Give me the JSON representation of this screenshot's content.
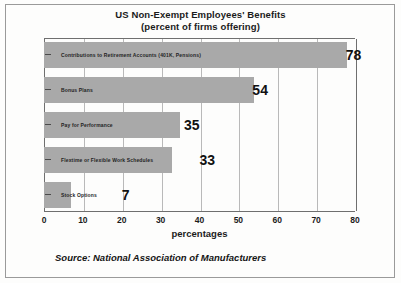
{
  "chart_data": {
    "type": "bar",
    "orientation": "horizontal",
    "title": "US Non-Exempt Employees' Benefits",
    "subtitle": "(percent of firms offering)",
    "xlabel": "percentages",
    "ylabel": "",
    "xlim": [
      0,
      80
    ],
    "xticks": [
      0,
      10,
      20,
      30,
      40,
      50,
      60,
      70,
      80
    ],
    "xtick_labels": [
      "0",
      "10",
      "20",
      "30",
      "40",
      "50",
      "60",
      "70",
      "80"
    ],
    "grid": true,
    "grid_axis": "x",
    "legend": false,
    "categories": [
      "Contributions to Retirement Accounts (401K, Pensions)",
      "Bonus Plans",
      "Pay for Performance",
      "Flextime or Flexible Work Schedules",
      "Stock Options"
    ],
    "values": [
      78,
      54,
      35,
      33,
      7
    ],
    "value_labels": [
      "78",
      "54",
      "35",
      "33",
      "7"
    ],
    "source": "Source:  National Association of Manufacturers",
    "bar_color": "#a9a9a9",
    "text_color": "#1b1b1b",
    "background_color": "#fdfdfc"
  },
  "bars": [
    {
      "label": "Contributions to Retirement Accounts (401K, Pensions)",
      "value": 78,
      "value_label": "78",
      "label_offset_pct": 97
    },
    {
      "label": "Bonus Plans",
      "value": 54,
      "value_label": "54",
      "label_offset_pct": 67
    },
    {
      "label": "Pay for Performance",
      "value": 35,
      "value_label": "35",
      "label_offset_pct": 45
    },
    {
      "label": "Flextime or Flexible Work Schedules",
      "value": 33,
      "value_label": "33",
      "label_offset_pct": 50
    },
    {
      "label": "Stock Options",
      "value": 7,
      "value_label": "7",
      "label_offset_pct": 25
    }
  ]
}
